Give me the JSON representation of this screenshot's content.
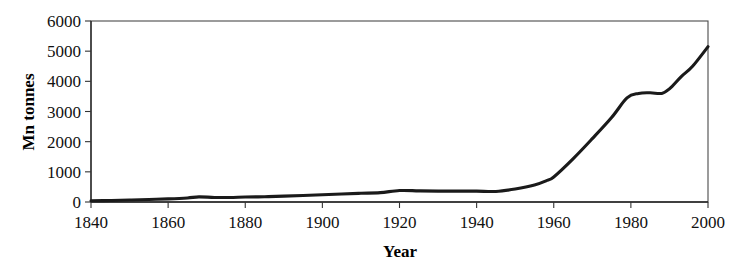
{
  "chart_data": {
    "type": "line",
    "title": "",
    "subtitle": "",
    "xlabel": "Year",
    "ylabel": "Mn tonnes",
    "xlim": [
      1840,
      2000
    ],
    "ylim": [
      0,
      6000
    ],
    "grid": false,
    "legend": false,
    "legend_position": "none",
    "x_tick_labels": [
      "1840",
      "1860",
      "1880",
      "1900",
      "1920",
      "1940",
      "1960",
      "1980",
      "2000"
    ],
    "x_ticks": [
      1840,
      1860,
      1880,
      1900,
      1920,
      1940,
      1960,
      1980,
      2000
    ],
    "y_tick_labels": [
      "0",
      "1000",
      "2000",
      "3000",
      "4000",
      "5000",
      "6000"
    ],
    "y_ticks": [
      0,
      1000,
      2000,
      3000,
      4000,
      5000,
      6000
    ],
    "series": [
      {
        "name": "Mn tonnes",
        "color": "#1a1a1a",
        "x": [
          1840,
          1845,
          1850,
          1855,
          1860,
          1865,
          1868,
          1872,
          1876,
          1880,
          1885,
          1890,
          1895,
          1900,
          1905,
          1910,
          1915,
          1920,
          1925,
          1930,
          1935,
          1940,
          1945,
          1950,
          1955,
          1958,
          1960,
          1965,
          1970,
          1975,
          1979,
          1982,
          1985,
          1988,
          1990,
          1993,
          1996,
          2000
        ],
        "y": [
          40,
          50,
          65,
          85,
          105,
          135,
          170,
          150,
          150,
          165,
          175,
          195,
          215,
          240,
          265,
          290,
          310,
          380,
          370,
          360,
          360,
          360,
          350,
          430,
          560,
          700,
          830,
          1430,
          2100,
          2800,
          3450,
          3600,
          3620,
          3600,
          3750,
          4150,
          4500,
          5150
        ]
      }
    ]
  },
  "axes": {
    "x_axis_name": "Year",
    "y_axis_name": "Mn tonnes"
  }
}
